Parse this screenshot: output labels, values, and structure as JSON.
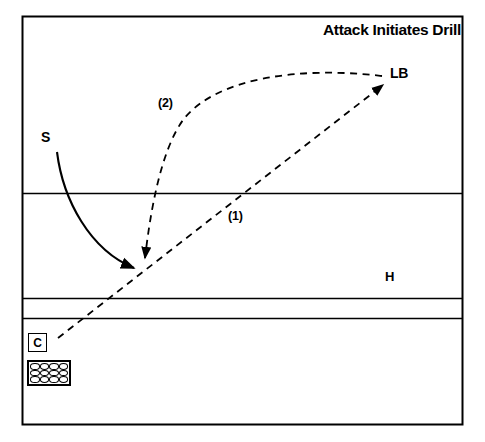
{
  "diagram": {
    "title": "Attack Initiates Drill",
    "type": "volleyball-drill-court-diagram",
    "colors": {
      "line": "#000000",
      "background": "#ffffff",
      "text": "#000000"
    },
    "court": {
      "border": {
        "x": 22,
        "y": 16,
        "width": 441,
        "height": 409
      },
      "lines": [
        {
          "name": "attack-line-front",
          "y": 193
        },
        {
          "name": "attack-line-back",
          "y": 298
        },
        {
          "name": "end-line",
          "y": 318
        }
      ]
    },
    "players": [
      {
        "name": "setter",
        "label": "S",
        "x": 45,
        "y": 140
      },
      {
        "name": "left-back",
        "label": "LB",
        "x": 390,
        "y": 66
      },
      {
        "name": "hitter",
        "label": "H",
        "x": 385,
        "y": 270
      },
      {
        "name": "coach",
        "label": "C",
        "x": 28,
        "y": 333
      }
    ],
    "equipment": {
      "ball_cart": {
        "name": "ball-cart",
        "columns": 4,
        "rows": 3,
        "ball_count": 12
      }
    },
    "movements": [
      {
        "step": "(1)",
        "name": "coach-toss-to-left-back",
        "style": "dashed",
        "label_x": 228,
        "label_y": 210,
        "from": "C",
        "to": "LB"
      },
      {
        "step": "(2)",
        "name": "left-back-pass-to-setter",
        "style": "dashed",
        "label_x": 158,
        "label_y": 97,
        "from": "LB",
        "to": "S"
      },
      {
        "step": "",
        "name": "setter-movement",
        "style": "solid",
        "from": "S",
        "to": "setting-position"
      }
    ],
    "balls": [
      "ball-1",
      "ball-2",
      "ball-3",
      "ball-4",
      "ball-5",
      "ball-6",
      "ball-7",
      "ball-8",
      "ball-9",
      "ball-10",
      "ball-11",
      "ball-12"
    ]
  }
}
